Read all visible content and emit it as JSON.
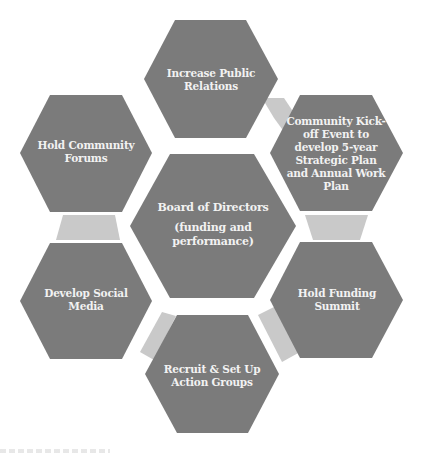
{
  "diagram": {
    "type": "hexagon-cluster",
    "colors": {
      "hexagon_fill": "#7b7b7b",
      "connector_fill": "#c9c9c9",
      "label_text": "#f2f2f2",
      "background": "#ffffff"
    },
    "center": {
      "title": "Board of Directors",
      "subtitle_line1": "(funding and",
      "subtitle_line2": "performance)"
    },
    "nodes": [
      {
        "position": "top",
        "lines": [
          "Increase Public",
          "Relations"
        ]
      },
      {
        "position": "top-right",
        "lines": [
          "Community Kick-",
          "off Event to",
          "develop 5-year",
          "Strategic Plan",
          "and Annual Work",
          "Plan"
        ]
      },
      {
        "position": "bottom-right",
        "lines": [
          "Hold Funding",
          "Summit"
        ]
      },
      {
        "position": "bottom",
        "lines": [
          "Recruit & Set Up",
          "Action Groups"
        ]
      },
      {
        "position": "bottom-left",
        "lines": [
          "Develop Social",
          "Media"
        ]
      },
      {
        "position": "top-left",
        "lines": [
          "Hold Community",
          "Forums"
        ]
      }
    ]
  }
}
